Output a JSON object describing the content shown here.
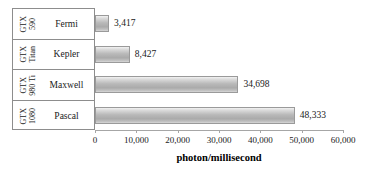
{
  "chart_data": {
    "type": "bar",
    "orientation": "horizontal",
    "title": "",
    "xlabel": "photon/millisecond",
    "ylabel": "",
    "xlim": [
      0,
      60000
    ],
    "grid": false,
    "legend": null,
    "categories": [
      "Fermi",
      "Kepler",
      "Maxwell",
      "Pascal"
    ],
    "values": [
      3417,
      8427,
      34698,
      48333
    ],
    "value_labels": [
      "3,417",
      "8,427",
      "34,698",
      "48,333"
    ],
    "category_sublabels": [
      {
        "line1": "GTX",
        "line2": "590"
      },
      {
        "line1": "GTX",
        "line2": "Titan"
      },
      {
        "line1": "GTX",
        "line2": "980 Ti"
      },
      {
        "line1": "GTX",
        "line2": "1080"
      }
    ],
    "xticks": [
      0,
      10000,
      20000,
      30000,
      40000,
      50000,
      60000
    ],
    "xtick_labels": [
      "0",
      "10,000",
      "20,000",
      "30,000",
      "40,000",
      "50,000",
      "60,000"
    ],
    "colors": {
      "bar_fill_light": "#f2f2f2",
      "bar_fill_dark": "#aaaaaa",
      "bar_border": "#9a9a9a",
      "axis": "#a6a6a6",
      "table_border": "#8d8d8d",
      "text": "#1a1a1a",
      "background": "#ffffff"
    }
  },
  "rows": [
    {
      "gpu_line1": "GTX",
      "gpu_line2": "590",
      "architecture": "Fermi",
      "value_label": "3,417"
    },
    {
      "gpu_line1": "GTX",
      "gpu_line2": "Titan",
      "architecture": "Kepler",
      "value_label": "8,427"
    },
    {
      "gpu_line1": "GTX",
      "gpu_line2": "980 Ti",
      "architecture": "Maxwell",
      "value_label": "34,698"
    },
    {
      "gpu_line1": "GTX",
      "gpu_line2": "1080",
      "architecture": "Pascal",
      "value_label": "48,333"
    }
  ],
  "axis": {
    "title": "photon/millisecond",
    "ticks": [
      "0",
      "10,000",
      "20,000",
      "30,000",
      "40,000",
      "50,000",
      "60,000"
    ]
  }
}
